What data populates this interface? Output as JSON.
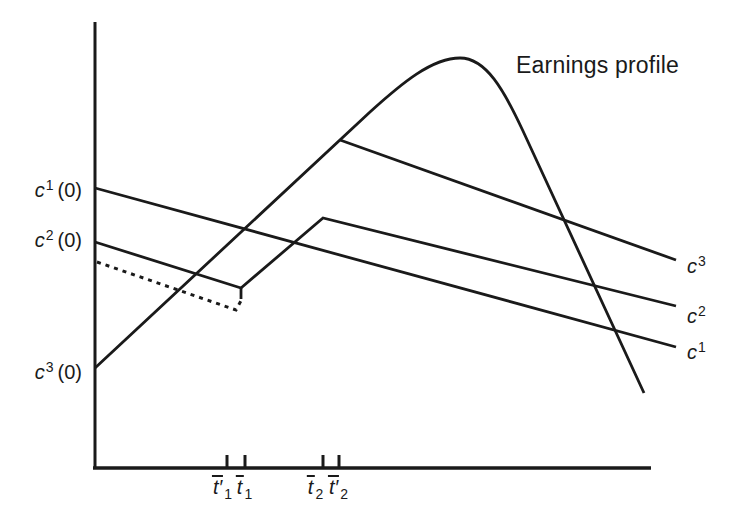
{
  "page": {
    "bg": "#ffffff",
    "ink": "#1a1a1a"
  },
  "annotation": {
    "earnings_label": "Earnings profile"
  },
  "y_axis_labels": [
    {
      "var": "c",
      "sup": "1",
      "paren": "(0)"
    },
    {
      "var": "c",
      "sup": "2",
      "paren": "(0)"
    },
    {
      "var": "c",
      "sup": "3",
      "paren": "(0)"
    }
  ],
  "curve_labels": [
    {
      "var": "c",
      "sup": "3"
    },
    {
      "var": "c",
      "sup": "2"
    },
    {
      "var": "c",
      "sup": "1"
    }
  ],
  "x_tick_labels": [
    {
      "base": "t",
      "prime": "′",
      "sub": "1"
    },
    {
      "base": "t",
      "prime": "",
      "sub": "1"
    },
    {
      "base": "t",
      "prime": "",
      "sub": "2"
    },
    {
      "base": "t",
      "prime": "′",
      "sub": "2"
    }
  ],
  "chart_data": {
    "type": "line",
    "title": "",
    "xlabel": "",
    "ylabel": "",
    "grid": false,
    "axes": {
      "y_axis": {
        "x": 95,
        "y_top": 22,
        "y_bottom": 469,
        "width": 3
      },
      "x_axis": {
        "y": 468,
        "x_left": 93,
        "x_right": 651,
        "width": 3.5
      },
      "tick_xs": [
        227,
        245,
        323,
        339
      ],
      "tick_top": 455,
      "tick_width": 3
    },
    "y_label_anchor_ys": [
      188,
      242,
      368
    ],
    "series": [
      {
        "name": "earnings-profile",
        "style": "solid",
        "width": 2.8,
        "d": "M95,368 L370,112 C402,83 432,58 460,58 C486,58 504,90 523,131 L644,393",
        "note": "hump-shaped earnings curve; rises linearly from c3(0) on the axis, peaks near x=460, falls steeply"
      },
      {
        "name": "c1-path",
        "style": "solid",
        "width": 2.8,
        "d": "M95,188 L676,347",
        "note": "consumption path 1: straight decline from c1(0)"
      },
      {
        "name": "c2-path",
        "style": "solid",
        "width": 2.8,
        "d": "M95,242 L241,288 L323,218 L676,306",
        "note": "consumption path 2: declines to kink at t1, rises parallel to earnings until t2, then declines"
      },
      {
        "name": "c2-jump-tick",
        "style": "solid",
        "width": 2.8,
        "d": "M241,288 L241,299",
        "note": "small vertical jump mark at the t1 kink"
      },
      {
        "name": "c3-path",
        "style": "solid",
        "width": 2.8,
        "d": "M340,140 L676,260",
        "note": "consumption path 3: branches off earnings line above t2-prime, declines to the right"
      },
      {
        "name": "dotted-alternative-path",
        "style": "dotted",
        "width": 3,
        "d": "M97,262 L236,310 L243,297",
        "note": "dotted alternative path just below c2, kinks up near t1-prime"
      }
    ]
  }
}
